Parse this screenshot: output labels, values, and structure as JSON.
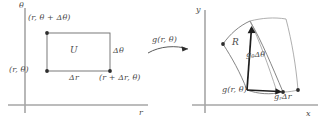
{
  "figure": {
    "type": "math-diagram",
    "stroke_color": "#555555",
    "axis_color": "#9a9a9a",
    "text_color": "#4a4a4a",
    "background": "#ffffff"
  },
  "left_panel": {
    "name": "rtheta-plane",
    "axes": {
      "vertical_label": "θ",
      "horizontal_label": "r"
    },
    "region_label": "U",
    "corner_labels": {
      "top_left": "(r, θ + Δθ)",
      "bottom_left": "(r, θ)",
      "bottom_right": "(r + Δr, θ)"
    },
    "edge_labels": {
      "bottom": "Δr",
      "right": "Δθ"
    },
    "points": [
      {
        "name": "top-left-vertex",
        "x": 47,
        "y": 33
      },
      {
        "name": "bottom-left-vertex",
        "x": 47,
        "y": 71
      },
      {
        "name": "bottom-right-vertex",
        "x": 110,
        "y": 71
      }
    ]
  },
  "arrow": {
    "name": "transformation-arrow",
    "label": "g(r, θ)"
  },
  "right_panel": {
    "name": "xy-plane",
    "axes": {
      "vertical_label": "y",
      "horizontal_label": "x"
    },
    "region_label": "R",
    "vector_labels": {
      "base_point": "g(r, θ)",
      "theta_vector": "g",
      "theta_vector_sub": "θ",
      "theta_vector_rest": "Δθ",
      "r_vector": "g",
      "r_vector_sub": "r",
      "r_vector_rest": "Δr"
    }
  }
}
